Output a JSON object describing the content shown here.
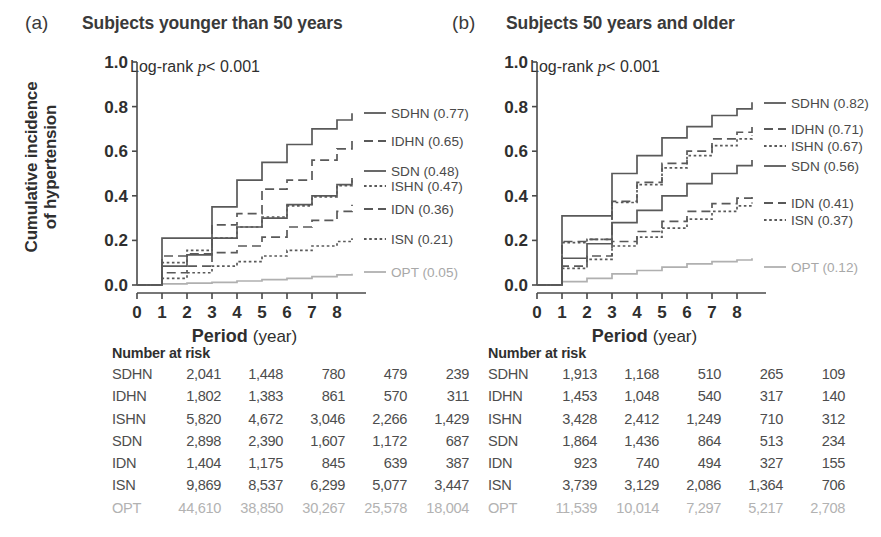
{
  "figure": {
    "xlabel_bold": "Period",
    "xlabel_unit": "(year)",
    "ylabel_line1": "Cumulative incidence",
    "ylabel_line2": "of hypertension",
    "risk_title": "Number at risk",
    "colors": {
      "curve": "#595959",
      "opt": "#b0b0b0",
      "axis": "#4a4a4a",
      "text": "#3a3a3a"
    }
  },
  "panels": [
    {
      "letter": "(a)",
      "title": "Subjects younger than 50 years",
      "logrank_prefix": "Log-rank ",
      "logrank_p": "p",
      "logrank_value": "< 0.001",
      "yticks": [
        "1.0",
        "0.8",
        "0.6",
        "0.4",
        "0.2",
        "0.0"
      ],
      "xticks": [
        "0",
        "1",
        "2",
        "3",
        "4",
        "5",
        "6",
        "7",
        "8"
      ],
      "legend": [
        {
          "name": "SDHN",
          "value": "(0.77)",
          "label": "SDHN (0.77)",
          "style": "solid",
          "opt": false,
          "y": 113
        },
        {
          "name": "IDHN",
          "value": "(0.65)",
          "label": "IDHN (0.65)",
          "style": "dashed",
          "opt": false,
          "y": 141
        },
        {
          "name": "SDN",
          "value": "(0.48)",
          "label": "SDN (0.48)",
          "style": "solid",
          "opt": false,
          "y": 171
        },
        {
          "name": "ISHN",
          "value": "(0.47)",
          "label": "ISHN (0.47)",
          "style": "dotted",
          "opt": false,
          "y": 186
        },
        {
          "name": "IDN",
          "value": "(0.36)",
          "label": "IDN (0.36)",
          "style": "dashed",
          "opt": false,
          "y": 209
        },
        {
          "name": "ISN",
          "value": "(0.21)",
          "label": "ISN (0.21)",
          "style": "dotted",
          "opt": false,
          "y": 239
        },
        {
          "name": "OPT",
          "value": "(0.05)",
          "label": "OPT (0.05)",
          "style": "solid",
          "opt": true,
          "y": 272
        }
      ],
      "risk_columns": [
        "0",
        "2",
        "4",
        "6",
        "8"
      ],
      "risk_rows": [
        {
          "label": "SDHN",
          "values": [
            "2,041",
            "1,448",
            "780",
            "479",
            "239"
          ],
          "opt": false
        },
        {
          "label": "IDHN",
          "values": [
            "1,802",
            "1,383",
            "861",
            "570",
            "311"
          ],
          "opt": false
        },
        {
          "label": "ISHN",
          "values": [
            "5,820",
            "4,672",
            "3,046",
            "2,266",
            "1,429"
          ],
          "opt": false
        },
        {
          "label": "SDN",
          "values": [
            "2,898",
            "2,390",
            "1,607",
            "1,172",
            "687"
          ],
          "opt": false
        },
        {
          "label": "IDN",
          "values": [
            "1,404",
            "1,175",
            "845",
            "639",
            "387"
          ],
          "opt": false
        },
        {
          "label": "ISN",
          "values": [
            "9,869",
            "8,537",
            "6,299",
            "5,077",
            "3,447"
          ],
          "opt": false
        },
        {
          "label": "OPT",
          "values": [
            "44,610",
            "38,850",
            "30,267",
            "25,578",
            "18,004"
          ],
          "opt": true
        }
      ]
    },
    {
      "letter": "(b)",
      "title": "Subjects 50 years and older",
      "logrank_prefix": "Log-rank ",
      "logrank_p": "p",
      "logrank_value": "< 0.001",
      "yticks": [
        "1.0",
        "0.8",
        "0.6",
        "0.4",
        "0.2",
        "0.0"
      ],
      "xticks": [
        "0",
        "1",
        "2",
        "3",
        "4",
        "5",
        "6",
        "7",
        "8"
      ],
      "legend": [
        {
          "name": "SDHN",
          "value": "(0.82)",
          "label": "SDHN (0.82)",
          "style": "solid",
          "opt": false,
          "y": 103
        },
        {
          "name": "IDHN",
          "value": "(0.71)",
          "label": "IDHN (0.71)",
          "style": "dashed",
          "opt": false,
          "y": 129
        },
        {
          "name": "ISHN",
          "value": "(0.67)",
          "label": "ISHN (0.67)",
          "style": "dotted",
          "opt": false,
          "y": 146
        },
        {
          "name": "SDN",
          "value": "(0.56)",
          "label": "SDN (0.56)",
          "style": "solid",
          "opt": false,
          "y": 166
        },
        {
          "name": "IDN",
          "value": "(0.41)",
          "label": "IDN (0.41)",
          "style": "dashed",
          "opt": false,
          "y": 203
        },
        {
          "name": "ISN",
          "value": "(0.37)",
          "label": "ISN (0.37)",
          "style": "dotted",
          "opt": false,
          "y": 220
        },
        {
          "name": "OPT",
          "value": "(0.12)",
          "label": "OPT (0.12)",
          "style": "solid",
          "opt": true,
          "y": 267
        }
      ],
      "risk_columns": [
        "0",
        "2",
        "4",
        "6",
        "8"
      ],
      "risk_rows": [
        {
          "label": "SDHN",
          "values": [
            "1,913",
            "1,168",
            "510",
            "265",
            "109"
          ],
          "opt": false
        },
        {
          "label": "IDHN",
          "values": [
            "1,453",
            "1,048",
            "540",
            "317",
            "140"
          ],
          "opt": false
        },
        {
          "label": "ISHN",
          "values": [
            "3,428",
            "2,412",
            "1,249",
            "710",
            "312"
          ],
          "opt": false
        },
        {
          "label": "SDN",
          "values": [
            "1,864",
            "1,436",
            "864",
            "513",
            "234"
          ],
          "opt": false
        },
        {
          "label": "IDN",
          "values": [
            "923",
            "740",
            "494",
            "327",
            "155"
          ],
          "opt": false
        },
        {
          "label": "ISN",
          "values": [
            "3,739",
            "3,129",
            "2,086",
            "1,364",
            "706"
          ],
          "opt": false
        },
        {
          "label": "OPT",
          "values": [
            "11,539",
            "10,014",
            "7,297",
            "5,217",
            "2,708"
          ],
          "opt": true
        }
      ]
    }
  ],
  "chart_data": [
    {
      "type": "line",
      "subplot": "(a)",
      "title": "Subjects younger than 50 years",
      "xlabel": "Period (year)",
      "ylabel": "Cumulative incidence of hypertension",
      "xlim": [
        0,
        8.6
      ],
      "ylim": [
        0.0,
        1.0
      ],
      "xticks": [
        0,
        1,
        2,
        3,
        4,
        5,
        6,
        7,
        8
      ],
      "yticks": [
        0.0,
        0.2,
        0.4,
        0.6,
        0.8,
        1.0
      ],
      "grid": false,
      "legend_position": "right-outside",
      "annotation": "Log-rank p < 0.001",
      "x": [
        0,
        1,
        2,
        3,
        4,
        5,
        6,
        7,
        8,
        8.6
      ],
      "series": [
        {
          "name": "SDHN",
          "style": "solid",
          "final": 0.77,
          "values": [
            0.0,
            0.21,
            0.21,
            0.35,
            0.47,
            0.55,
            0.63,
            0.7,
            0.74,
            0.77
          ]
        },
        {
          "name": "IDHN",
          "style": "dashed",
          "final": 0.65,
          "values": [
            0.0,
            0.13,
            0.14,
            0.27,
            0.32,
            0.43,
            0.47,
            0.56,
            0.61,
            0.65
          ]
        },
        {
          "name": "SDN",
          "style": "solid",
          "final": 0.48,
          "values": [
            0.0,
            0.085,
            0.135,
            0.21,
            0.26,
            0.3,
            0.36,
            0.4,
            0.45,
            0.48
          ]
        },
        {
          "name": "ISHN",
          "style": "dotted",
          "final": 0.47,
          "values": [
            0.0,
            0.1,
            0.155,
            0.21,
            0.26,
            0.305,
            0.355,
            0.395,
            0.445,
            0.47
          ]
        },
        {
          "name": "IDN",
          "style": "dashed",
          "final": 0.36,
          "values": [
            0.0,
            0.055,
            0.085,
            0.145,
            0.175,
            0.215,
            0.26,
            0.29,
            0.33,
            0.36
          ]
        },
        {
          "name": "ISN",
          "style": "dotted",
          "final": 0.21,
          "values": [
            0.0,
            0.03,
            0.055,
            0.085,
            0.105,
            0.13,
            0.155,
            0.175,
            0.195,
            0.21
          ]
        },
        {
          "name": "OPT",
          "style": "solid",
          "final": 0.05,
          "values": [
            0.0,
            0.005,
            0.008,
            0.012,
            0.018,
            0.024,
            0.03,
            0.038,
            0.045,
            0.05
          ]
        }
      ]
    },
    {
      "type": "line",
      "subplot": "(b)",
      "title": "Subjects 50 years and older",
      "xlabel": "Period (year)",
      "ylabel": "Cumulative incidence of hypertension",
      "xlim": [
        0,
        8.6
      ],
      "ylim": [
        0.0,
        1.0
      ],
      "xticks": [
        0,
        1,
        2,
        3,
        4,
        5,
        6,
        7,
        8
      ],
      "yticks": [
        0.0,
        0.2,
        0.4,
        0.6,
        0.8,
        1.0
      ],
      "grid": false,
      "legend_position": "right-outside",
      "annotation": "Log-rank p < 0.001",
      "x": [
        0,
        1,
        2,
        3,
        4,
        5,
        6,
        7,
        8,
        8.6
      ],
      "series": [
        {
          "name": "SDHN",
          "style": "solid",
          "final": 0.82,
          "values": [
            0.0,
            0.31,
            0.31,
            0.5,
            0.58,
            0.66,
            0.71,
            0.76,
            0.79,
            0.82
          ]
        },
        {
          "name": "IDHN",
          "style": "dashed",
          "final": 0.71,
          "values": [
            0.0,
            0.195,
            0.205,
            0.375,
            0.46,
            0.545,
            0.6,
            0.655,
            0.685,
            0.71
          ]
        },
        {
          "name": "ISHN",
          "style": "dotted",
          "final": 0.67,
          "values": [
            0.0,
            0.19,
            0.205,
            0.37,
            0.45,
            0.525,
            0.58,
            0.625,
            0.655,
            0.67
          ]
        },
        {
          "name": "SDN",
          "style": "solid",
          "final": 0.56,
          "values": [
            0.0,
            0.12,
            0.185,
            0.28,
            0.335,
            0.4,
            0.455,
            0.5,
            0.535,
            0.56
          ]
        },
        {
          "name": "IDN",
          "style": "dashed",
          "final": 0.41,
          "values": [
            0.0,
            0.085,
            0.13,
            0.195,
            0.24,
            0.285,
            0.33,
            0.365,
            0.39,
            0.41
          ]
        },
        {
          "name": "ISN",
          "style": "dotted",
          "final": 0.37,
          "values": [
            0.0,
            0.075,
            0.115,
            0.175,
            0.215,
            0.255,
            0.295,
            0.33,
            0.355,
            0.37
          ]
        },
        {
          "name": "OPT",
          "style": "solid",
          "final": 0.12,
          "values": [
            0.0,
            0.015,
            0.03,
            0.05,
            0.065,
            0.08,
            0.095,
            0.105,
            0.112,
            0.12
          ]
        }
      ]
    }
  ]
}
